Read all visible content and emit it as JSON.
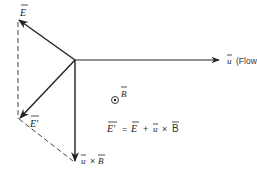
{
  "diagram": {
    "vectors": {
      "E": {
        "label": "E",
        "overbar": true
      },
      "E_prime": {
        "label": "E'",
        "overbar": true
      },
      "uxB": {
        "label_u": "u",
        "label_cross": "×",
        "label_B": "B"
      },
      "u": {
        "label": "u",
        "caption": "(Flow velocity)"
      }
    },
    "magnetic_field": {
      "symbol": "⊙",
      "label": "B"
    },
    "equation": {
      "lhs": "E'",
      "equals": "=",
      "term1": "E",
      "plus": "+",
      "term2_u": "u",
      "cross": "×",
      "term2_B": "B"
    },
    "colors": {
      "ink": "#222222",
      "background": "#ffffff"
    }
  }
}
